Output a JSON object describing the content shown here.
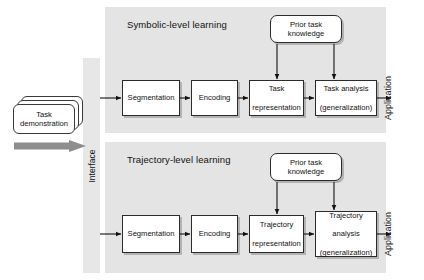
{
  "diagram": {
    "input": {
      "stack_label": "Task\ndemonstration",
      "stack_label_line1": "Task",
      "stack_label_line2": "demonstration",
      "arrow_icon": "thick-gray-right-arrow"
    },
    "interface": {
      "label": "Interface",
      "orientation": "vertical"
    },
    "panels": [
      {
        "id": "symbolic",
        "title": "Symbolic-level learning",
        "knowledge_box": {
          "line1": "Prior task",
          "line2": "knowledge"
        },
        "steps": [
          {
            "id": "segmentation",
            "line1": "Segmentation",
            "line2": "",
            "line3": ""
          },
          {
            "id": "encoding",
            "line1": "Encoding",
            "line2": "",
            "line3": ""
          },
          {
            "id": "representation",
            "line1": "Task",
            "line2": "representation",
            "line3": ""
          },
          {
            "id": "analysis",
            "line1": "Task analysis",
            "line2": "(generalization)",
            "line3": ""
          }
        ],
        "output_label": "Application"
      },
      {
        "id": "trajectory",
        "title": "Trajectory-level learning",
        "knowledge_box": {
          "line1": "Prior task",
          "line2": "knowledge"
        },
        "steps": [
          {
            "id": "segmentation",
            "line1": "Segmentation",
            "line2": "",
            "line3": ""
          },
          {
            "id": "encoding",
            "line1": "Encoding",
            "line2": "",
            "line3": ""
          },
          {
            "id": "representation",
            "line1": "Trajectory",
            "line2": "representation",
            "line3": ""
          },
          {
            "id": "analysis",
            "line1": "Trajectory",
            "line2": "analysis",
            "line3": "(generalization)"
          }
        ],
        "output_label": "Application"
      }
    ],
    "colors": {
      "panel_background": "#e4e4e4",
      "interface_background": "#e7e7e7",
      "box_fill": "#ffffff",
      "box_stroke": "#2b2b2b",
      "arrow_stroke": "#111111",
      "gray_arrow_fill": "#8e8e8e",
      "page_background": "#ffffff"
    }
  }
}
